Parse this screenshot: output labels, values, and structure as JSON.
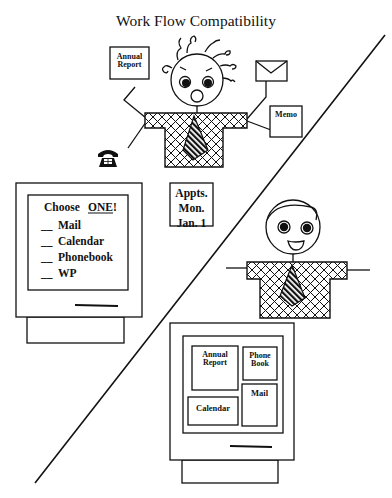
{
  "title": "Work Flow Compatibility",
  "stressed_user": {
    "documents": {
      "annual_report": [
        "Annual",
        "Report"
      ],
      "memo": "Memo",
      "appointments": [
        "Appts.",
        "Mon.",
        "Jan. 1"
      ]
    },
    "icons": [
      "telephone-icon",
      "envelope-icon"
    ],
    "expression": "shocked"
  },
  "left_monitor": {
    "prompt": "Choose",
    "emphasis": "ONE!",
    "options": [
      {
        "blank": "__",
        "label": "Mail"
      },
      {
        "blank": "__",
        "label": "Calendar"
      },
      {
        "blank": "__",
        "label": "Phonebook"
      },
      {
        "blank": "__",
        "label": "WP"
      }
    ]
  },
  "happy_user": {
    "expression": "smiling"
  },
  "right_monitor": {
    "windows": {
      "annual_report": [
        "Annual",
        "Report"
      ],
      "phone_book": [
        "Phone",
        "Book"
      ],
      "mail": "Mail",
      "calendar": "Calendar"
    }
  },
  "colors": {
    "ink": "#111111",
    "background": "#ffffff"
  }
}
